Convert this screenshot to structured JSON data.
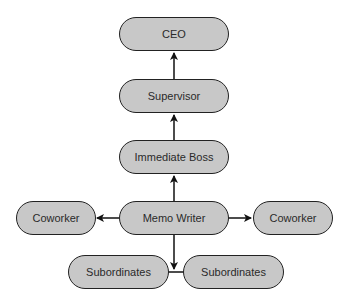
{
  "diagram": {
    "type": "organizational communication hierarchy",
    "colors": {
      "node_fill": "#c8c8c8",
      "node_border": "#222222",
      "edge": "#111111",
      "background": "#ffffff"
    },
    "nodes": {
      "ceo": {
        "label": "CEO"
      },
      "supervisor": {
        "label": "Supervisor"
      },
      "immediate_boss": {
        "label": "Immediate Boss"
      },
      "memo_writer": {
        "label": "Memo Writer"
      },
      "coworker_left": {
        "label": "Coworker"
      },
      "coworker_right": {
        "label": "Coworker"
      },
      "subordinates_left": {
        "label": "Subordinates"
      },
      "subordinates_right": {
        "label": "Subordinates"
      }
    },
    "edges": [
      {
        "from": "supervisor",
        "to": "ceo"
      },
      {
        "from": "immediate_boss",
        "to": "supervisor"
      },
      {
        "from": "memo_writer",
        "to": "immediate_boss"
      },
      {
        "from": "memo_writer",
        "to": "coworker_left"
      },
      {
        "from": "memo_writer",
        "to": "coworker_right"
      },
      {
        "from": "memo_writer",
        "to": "subordinates_left+subordinates_right"
      }
    ]
  }
}
